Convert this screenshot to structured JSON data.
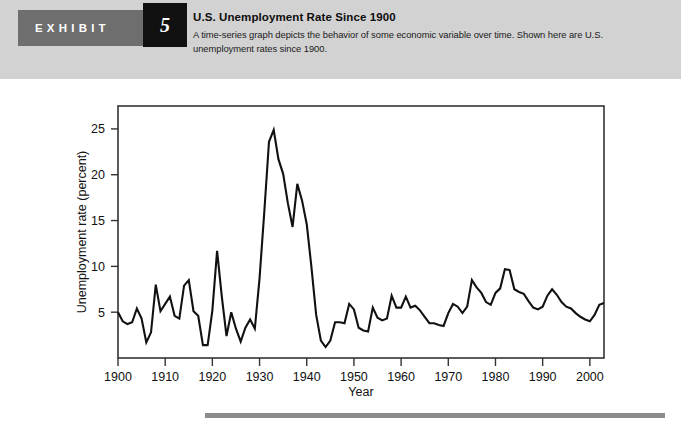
{
  "header": {
    "exhibit_label": "EXHIBIT",
    "exhibit_number": "5",
    "title": "U.S. Unemployment Rate Since 1900",
    "description": "A time-series graph depicts the behavior of some economic variable over time. Shown here are U.S. unemployment rates since 1900.",
    "band_color": "#d2d2d2",
    "tab_color": "#6e6e6e",
    "number_box_color": "#111111"
  },
  "chart_data": {
    "type": "line",
    "title": "U.S. Unemployment Rate Since 1900",
    "xlabel": "Year",
    "ylabel": "Unemployment rate (percent)",
    "xlim": [
      1900,
      2003
    ],
    "ylim": [
      0,
      27.5
    ],
    "xticks": [
      1900,
      1910,
      1920,
      1930,
      1940,
      1950,
      1960,
      1970,
      1980,
      1990,
      2000
    ],
    "yticks": [
      5,
      10,
      15,
      20,
      25
    ],
    "xtick_labels": [
      "1900",
      "1910",
      "1920",
      "1930",
      "1940",
      "1950",
      "1960",
      "1970",
      "1980",
      "1990",
      "2000"
    ],
    "ytick_labels": [
      "5",
      "10",
      "15",
      "20",
      "25"
    ],
    "grid": false,
    "legend": false,
    "line_color": "#111111",
    "line_width": 2.1,
    "plot_background": "#ffffff",
    "frame_color": "#333333",
    "series_name": "U.S. unemployment rate",
    "x": [
      1900,
      1901,
      1902,
      1903,
      1904,
      1905,
      1906,
      1907,
      1908,
      1909,
      1910,
      1911,
      1912,
      1913,
      1914,
      1915,
      1916,
      1917,
      1918,
      1919,
      1920,
      1921,
      1922,
      1923,
      1924,
      1925,
      1926,
      1927,
      1928,
      1929,
      1930,
      1931,
      1932,
      1933,
      1934,
      1935,
      1936,
      1937,
      1938,
      1939,
      1940,
      1941,
      1942,
      1943,
      1944,
      1945,
      1946,
      1947,
      1948,
      1949,
      1950,
      1951,
      1952,
      1953,
      1954,
      1955,
      1956,
      1957,
      1958,
      1959,
      1960,
      1961,
      1962,
      1963,
      1964,
      1965,
      1966,
      1967,
      1968,
      1969,
      1970,
      1971,
      1972,
      1973,
      1974,
      1975,
      1976,
      1977,
      1978,
      1979,
      1980,
      1981,
      1982,
      1983,
      1984,
      1985,
      1986,
      1987,
      1988,
      1989,
      1990,
      1991,
      1992,
      1993,
      1994,
      1995,
      1996,
      1997,
      1998,
      1999,
      2000,
      2001,
      2002,
      2003
    ],
    "values": [
      5.0,
      4.0,
      3.7,
      3.9,
      5.4,
      4.3,
      1.7,
      2.8,
      8.0,
      5.1,
      5.9,
      6.7,
      4.6,
      4.3,
      7.9,
      8.5,
      5.1,
      4.6,
      1.4,
      1.4,
      5.2,
      11.7,
      6.7,
      2.4,
      5.0,
      3.2,
      1.8,
      3.3,
      4.2,
      3.2,
      8.7,
      15.9,
      23.6,
      24.9,
      21.7,
      20.1,
      16.9,
      14.3,
      19.0,
      17.2,
      14.6,
      9.9,
      4.7,
      1.9,
      1.2,
      1.9,
      3.9,
      3.9,
      3.8,
      5.9,
      5.3,
      3.3,
      3.0,
      2.9,
      5.5,
      4.4,
      4.1,
      4.3,
      6.8,
      5.5,
      5.5,
      6.7,
      5.5,
      5.7,
      5.2,
      4.5,
      3.8,
      3.8,
      3.6,
      3.5,
      4.9,
      5.9,
      5.6,
      4.9,
      5.6,
      8.5,
      7.7,
      7.1,
      6.1,
      5.8,
      7.1,
      7.6,
      9.7,
      9.6,
      7.5,
      7.2,
      7.0,
      6.2,
      5.5,
      5.3,
      5.6,
      6.8,
      7.5,
      6.9,
      6.1,
      5.6,
      5.4,
      4.9,
      4.5,
      4.2,
      4.0,
      4.7,
      5.8,
      6.0
    ]
  },
  "bottom_rule_color": "#8c8c8c"
}
